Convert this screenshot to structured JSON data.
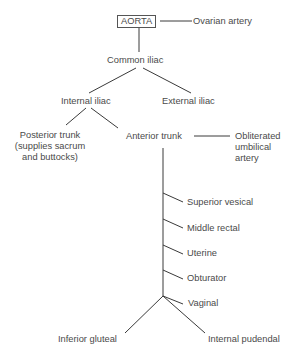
{
  "diagram": {
    "nodes": {
      "aorta": "AORTA",
      "ovarian": "Ovarian artery",
      "common_iliac": "Common iliac",
      "internal_iliac": "Internal iliac",
      "external_iliac": "External iliac",
      "posterior_trunk_1": "Posterior trunk",
      "posterior_trunk_2": "(supplies sacrum",
      "posterior_trunk_3": "and buttocks)",
      "anterior_trunk": "Anterior trunk",
      "obliterated_1": "Obliterated",
      "obliterated_2": "umbilical",
      "obliterated_3": "artery",
      "superior_vesical": "Superior vesical",
      "middle_rectal": "Middle rectal",
      "uterine": "Uterine",
      "obturator": "Obturator",
      "vaginal": "Vaginal",
      "inferior_gluteal": "Inferior gluteal",
      "internal_pudendal": "Internal pudendal"
    },
    "edges": [
      [
        "AORTA",
        "Ovarian artery"
      ],
      [
        "AORTA",
        "Common iliac"
      ],
      [
        "Common iliac",
        "Internal iliac"
      ],
      [
        "Common iliac",
        "External iliac"
      ],
      [
        "Internal iliac",
        "Posterior trunk"
      ],
      [
        "Internal iliac",
        "Anterior trunk"
      ],
      [
        "Anterior trunk",
        "Obliterated umbilical artery"
      ],
      [
        "Anterior trunk",
        "Superior vesical"
      ],
      [
        "Anterior trunk",
        "Middle rectal"
      ],
      [
        "Anterior trunk",
        "Uterine"
      ],
      [
        "Anterior trunk",
        "Obturator"
      ],
      [
        "Anterior trunk",
        "Vaginal"
      ],
      [
        "Anterior trunk",
        "Inferior gluteal"
      ],
      [
        "Anterior trunk",
        "Internal pudendal"
      ]
    ],
    "colors": {
      "line": "#3a3a3a",
      "text": "#4a4a4a",
      "background": "#ffffff"
    }
  }
}
